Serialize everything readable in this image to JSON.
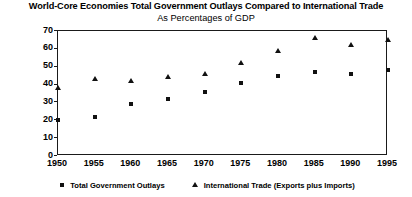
{
  "chart_data": {
    "type": "scatter",
    "title": "World-Core Economies Total Government Outlays Compared to International Trade",
    "subtitle": "As Percentages of GDP",
    "xlabel": "",
    "ylabel": "",
    "xlim": [
      1950,
      1995
    ],
    "ylim": [
      0,
      70
    ],
    "grid": false,
    "legend_position": "bottom",
    "x": [
      1950,
      1955,
      1960,
      1965,
      1970,
      1975,
      1980,
      1985,
      1990,
      1995
    ],
    "xticklabels": [
      "1950",
      "1955",
      "1960",
      "1965",
      "1970",
      "1975",
      "1980",
      "1985",
      "1990",
      "1995"
    ],
    "yticks": [
      0,
      10,
      20,
      30,
      40,
      50,
      60,
      70
    ],
    "yticklabels": [
      "0",
      "10",
      "20",
      "30",
      "40",
      "50",
      "60",
      "70"
    ],
    "series": [
      {
        "name": "Total Government Outlays",
        "marker": "square",
        "color": "#111111",
        "values": [
          20,
          22,
          29,
          32,
          36,
          41,
          45,
          47,
          46,
          48
        ]
      },
      {
        "name": "International Trade (Exports plus Imports)",
        "marker": "triangle",
        "color": "#111111",
        "values": [
          38,
          43,
          42,
          44,
          46,
          52,
          59,
          66,
          62,
          65
        ]
      }
    ]
  }
}
